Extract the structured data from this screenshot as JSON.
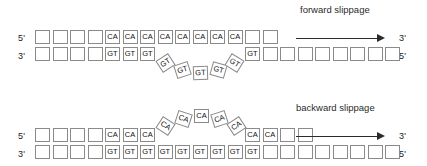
{
  "figure": {
    "background": "#ffffff",
    "line_color": "#8a8a8a",
    "text_color": "#111111"
  },
  "panels": [
    {
      "id": "forward",
      "caption": "forward slippage",
      "top_strand": {
        "left_label": "5'",
        "right_label": "3'",
        "cells": [
          "",
          "",
          "",
          "",
          "CA",
          "CA",
          "CA",
          "CA",
          "CA",
          "CA",
          "CA",
          "CA",
          "",
          ""
        ]
      },
      "bottom_strand": {
        "left_label": "3'",
        "right_label": "5'",
        "cells_before_loop": [
          "",
          "",
          "",
          "",
          "GT",
          "GT",
          "GT"
        ],
        "loop_cells": [
          "GT",
          "GT",
          "GT",
          "GT",
          "GT"
        ],
        "cells_after_loop": [
          "GT",
          "",
          "",
          "",
          "",
          "",
          "",
          "",
          ""
        ]
      },
      "arrow": "rightward-arrow"
    },
    {
      "id": "backward",
      "caption": "backward slippage",
      "top_strand": {
        "left_label": "5'",
        "right_label": "3'",
        "cells_before_loop": [
          "",
          "",
          "",
          "",
          "CA",
          "CA",
          "CA"
        ],
        "loop_cells": [
          "CA",
          "CA",
          "CA",
          "CA",
          "CA"
        ],
        "cells_after_loop": [
          "CA",
          "CA",
          "",
          ""
        ]
      },
      "bottom_strand": {
        "left_label": "3'",
        "right_label": "5'",
        "cells": [
          "",
          "",
          "",
          "",
          "GT",
          "GT",
          "GT",
          "GT",
          "GT",
          "GT",
          "GT",
          "GT",
          "GT",
          "",
          "",
          "",
          "",
          "",
          "",
          "",
          ""
        ]
      },
      "arrow": "rightward-arrow"
    }
  ]
}
